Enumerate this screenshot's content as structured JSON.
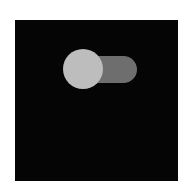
{
  "toggle": {
    "state": "off",
    "knob_position": "left",
    "colors": {
      "panel_background": "#050505",
      "track": "#6e6e6e",
      "knob": "#bdbdbd",
      "page_background": "#ffffff"
    }
  }
}
